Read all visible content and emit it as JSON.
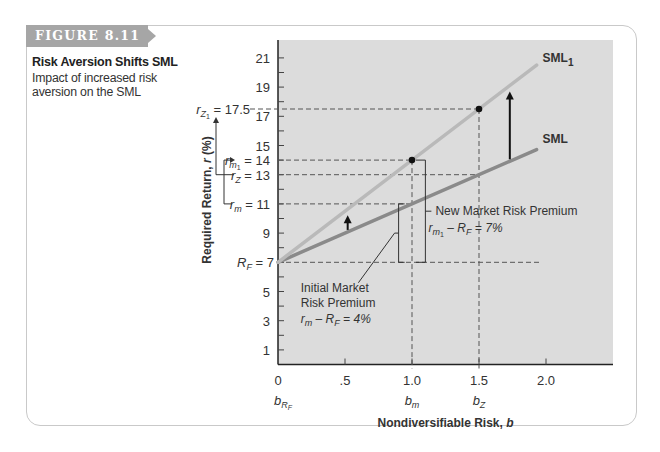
{
  "figure": {
    "tag": "FIGURE 8.11",
    "title": "Risk Aversion Shifts SML",
    "subtitle": "Impact of increased risk aversion on the SML"
  },
  "colors": {
    "plot_bg": "#dcdcdc",
    "sml": "#8a8a8a",
    "sml1": "#b9b9b9",
    "tag_bg": "#a6a6a6",
    "frame": "#c9c9c9",
    "ink": "#222222"
  },
  "axes": {
    "ylabel_main": "Required Return, ",
    "ylabel_var": "r",
    "ylabel_unit": " (%)",
    "xlabel_main": "Nondiversifiable Risk, ",
    "xlabel_var": "b",
    "y_ticks": [
      "1",
      "3",
      "5",
      "7",
      "9",
      "11",
      "13",
      "15",
      "17",
      "19",
      "21"
    ],
    "x_ticks": [
      "0",
      ".5",
      "1.0",
      "1.5",
      "2.0"
    ],
    "x_sub_labels": {
      "b_rf": {
        "base": "b",
        "sub": "R",
        "subsub": "F"
      },
      "b_m": {
        "base": "b",
        "sub": "m"
      },
      "b_z": {
        "base": "b",
        "sub": "Z"
      }
    }
  },
  "annotations": {
    "rz1": {
      "base": "r",
      "sub": "Z",
      "subsub": "1",
      "value": "= 17.5"
    },
    "rm1": {
      "base": "r",
      "sub": "m",
      "subsub": "1",
      "value": "= 14"
    },
    "rz": {
      "base": "r",
      "sub": "Z",
      "value": "= 13"
    },
    "rm": {
      "base": "r",
      "sub": "m",
      "value": "= 11"
    },
    "rf": {
      "base": "R",
      "sub": "F",
      "value": "= 7"
    },
    "sml1_label": "SML",
    "sml1_sub": "1",
    "sml_label": "SML",
    "new_premium_title": "New Market Risk Premium",
    "new_premium_formula": {
      "a": "r",
      "a_sub": "m",
      "a_subsub": "1",
      "mid": " – ",
      "b": "R",
      "b_sub": "F",
      "eq": " = 7%"
    },
    "initial_premium_line1": "Initial Market",
    "initial_premium_line2": "Risk Premium",
    "initial_premium_formula": {
      "a": "r",
      "a_sub": "m",
      "mid": " – ",
      "b": "R",
      "b_sub": "F",
      "eq": " = 4%"
    }
  },
  "chart_data": {
    "type": "line",
    "title": "Risk Aversion Shifts SML",
    "subtitle": "Impact of increased risk aversion on the SML",
    "xlabel": "Nondiversifiable Risk, b",
    "ylabel": "Required Return, r (%)",
    "xlim": [
      0,
      2.5
    ],
    "ylim": [
      0,
      22
    ],
    "x_ticks": [
      0,
      0.5,
      1.0,
      1.5,
      2.0
    ],
    "y_ticks": [
      1,
      3,
      5,
      7,
      9,
      11,
      13,
      15,
      17,
      19,
      21
    ],
    "grid": false,
    "series": [
      {
        "name": "SML",
        "x": [
          0,
          1.93
        ],
        "y": [
          7,
          14.72
        ],
        "slope": 4,
        "intercept": 7
      },
      {
        "name": "SML1",
        "x": [
          0,
          1.93
        ],
        "y": [
          7,
          20.51
        ],
        "slope": 7,
        "intercept": 7
      }
    ],
    "points": [
      {
        "label": "r_m1",
        "x": 1.0,
        "y": 14
      },
      {
        "label": "r_Z1",
        "x": 1.5,
        "y": 17.5
      }
    ],
    "reference_lines": {
      "horizontal": [
        7,
        11,
        13,
        14,
        17.5
      ],
      "vertical": [
        1.0,
        1.5
      ]
    },
    "annotations": [
      {
        "text": "R_F = 7",
        "y": 7
      },
      {
        "text": "r_m = 11",
        "y": 11
      },
      {
        "text": "r_Z = 13",
        "y": 13
      },
      {
        "text": "r_m1 = 14",
        "y": 14
      },
      {
        "text": "r_Z1 = 17.5",
        "y": 17.5
      },
      {
        "text": "Initial Market Risk Premium r_m − R_F = 4%"
      },
      {
        "text": "New Market Risk Premium r_m1 − R_F = 7%"
      },
      {
        "text": "b_RF",
        "x": 0
      },
      {
        "text": "b_m",
        "x": 1.0
      },
      {
        "text": "b_Z",
        "x": 1.5
      }
    ],
    "legend": "inline labels at line ends (SML, SML1)"
  }
}
